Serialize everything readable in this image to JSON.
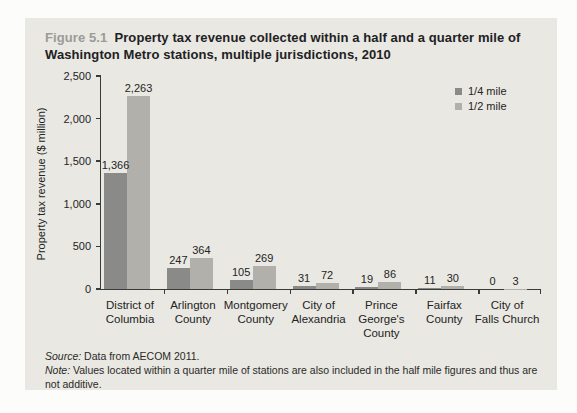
{
  "figure": {
    "label": "Figure 5.1",
    "title": "Property tax revenue collected within a half and a quarter mile of Washington Metro stations, multiple jurisdictions, 2010"
  },
  "chart_data": {
    "type": "bar",
    "title": "Property tax revenue collected within a half and a quarter mile of Washington Metro stations, multiple jurisdictions, 2010",
    "categories": [
      "District of\nColumbia",
      "Arlington\nCounty",
      "Montgomery\nCounty",
      "City of\nAlexandria",
      "Prince\nGeorge's\nCounty",
      "Fairfax\nCounty",
      "City of\nFalls Church"
    ],
    "series": [
      {
        "name": "1/4 mile",
        "color": "#8a8a88",
        "values": [
          1366,
          247,
          105,
          31,
          19,
          11,
          0
        ],
        "labels": [
          "1,366",
          "247",
          "105",
          "31",
          "19",
          "11",
          "0"
        ]
      },
      {
        "name": "1/2 mile",
        "color": "#b1b0ab",
        "values": [
          2263,
          364,
          269,
          72,
          86,
          30,
          3
        ],
        "labels": [
          "2,263",
          "364",
          "269",
          "72",
          "86",
          "30",
          "3"
        ]
      }
    ],
    "xlabel": "",
    "ylabel": "Property tax revenue ($ million)",
    "ylim": [
      0,
      2500
    ],
    "yticks": [
      "0",
      "500",
      "1,000",
      "1,500",
      "2,000",
      "2,500"
    ],
    "grid": false,
    "legend_position": "top-right"
  },
  "footer": {
    "source_label": "Source:",
    "source_text": "Data from AECOM 2011.",
    "note_label": "Note:",
    "note_text": "Values located within a quarter mile of stations are also included in the half mile figures and thus are not additive."
  }
}
